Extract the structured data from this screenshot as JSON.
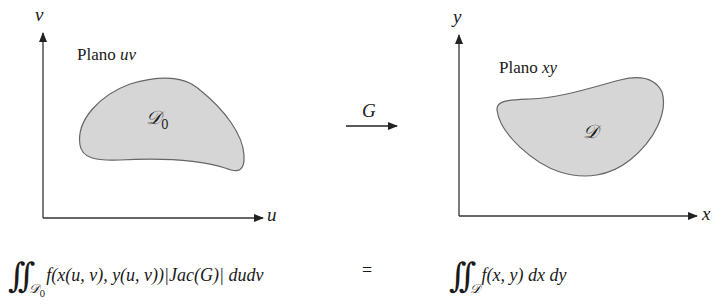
{
  "left_panel": {
    "plane_label_prefix": "Plano ",
    "plane_label_var": "uv",
    "axis_vertical": "v",
    "axis_horizontal": "u",
    "region_label": "𝒟",
    "region_subscript": "0",
    "region_fill": "#d6d6d6"
  },
  "mapping": {
    "label": "G",
    "arrow": "right-arrow"
  },
  "right_panel": {
    "plane_label_prefix": "Plano ",
    "plane_label_var": "xy",
    "axis_vertical": "y",
    "axis_horizontal": "x",
    "region_label": "𝒟",
    "region_fill": "#d6d6d6"
  },
  "formula": {
    "left_integral": "∫∫",
    "left_domain": "𝒟",
    "left_domain_subscript": "0",
    "left_integrand": "f(x(u, v), y(u, v))|Jac(G)| dudv",
    "equals": "=",
    "right_integral": "∫∫",
    "right_domain": "𝒟",
    "right_integrand": "f(x, y) dx dy"
  }
}
